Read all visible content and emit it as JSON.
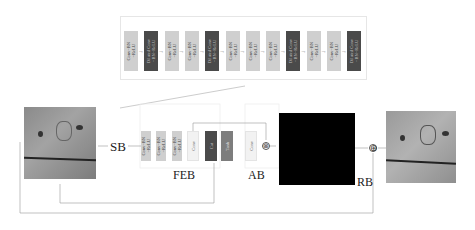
{
  "diagram": {
    "top_panel": {
      "blocks": [
        {
          "label": "Conv+BN\n+ReLU",
          "type": "light"
        },
        {
          "label": "Dilated Conv\n+BN+ReLU",
          "type": "dark"
        },
        {
          "label": "Conv+BN\n+ReLU",
          "type": "light"
        },
        {
          "label": "Conv+BN\n+ReLU",
          "type": "light"
        },
        {
          "label": "Dilated Conv\n+BN+ReLU",
          "type": "dark"
        },
        {
          "label": "Conv+BN\n+ReLU",
          "type": "light"
        },
        {
          "label": "Conv+BN\n+ReLU",
          "type": "light"
        },
        {
          "label": "Conv+BN\n+ReLU",
          "type": "light"
        },
        {
          "label": "Dilated Conv\n+BN+ReLU",
          "type": "dark"
        },
        {
          "label": "Conv+BN\n+ReLU",
          "type": "light"
        },
        {
          "label": "Conv+BN\n+ReLU",
          "type": "light"
        },
        {
          "label": "Dilated Conv\n+BN+ReLU",
          "type": "dark"
        }
      ]
    },
    "sb_label": "SB",
    "feb": {
      "label": "FEB",
      "blocks": [
        {
          "label": "Conv+BN\n+ReLU",
          "type": "light"
        },
        {
          "label": "Conv+BN\n+ReLU",
          "type": "light"
        },
        {
          "label": "Conv+BN\n+ReLU",
          "type": "light"
        },
        {
          "label": "Conv",
          "type": "pale"
        },
        {
          "label": "Cat",
          "type": "dark"
        },
        {
          "label": "Tanh",
          "type": "mid"
        }
      ]
    },
    "ab": {
      "label": "AB",
      "blocks": [
        {
          "label": "Conv",
          "type": "pale"
        }
      ],
      "operator": "⊗"
    },
    "rb": {
      "label": "RB"
    },
    "residual_operator": "⊕",
    "images": {
      "input": "noisy-input-image",
      "output": "denoised-output-image",
      "residual": "residual-noise-map"
    },
    "colors": {
      "light_block": "#cfcfcf",
      "dark_block": "#4a4a4a",
      "tanh_block": "#7d7d7d",
      "residual_map": "#000000"
    }
  }
}
